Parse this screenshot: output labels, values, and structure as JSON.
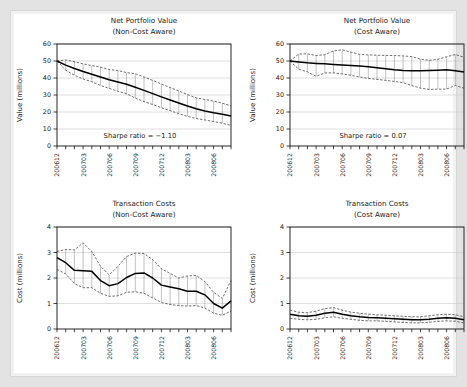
{
  "figure": {
    "background": "#ffffff",
    "frame_color": "#d8d8d8",
    "mean_color": "#000000",
    "band_color": "#333333",
    "grid_color": "#c9c9c9"
  },
  "chart_data": [
    {
      "id": "net-portfolio-value-non-cost-aware",
      "type": "line",
      "title": "Net Portfolio Value",
      "subtitle": "(Non-Cost Aware)",
      "xlabel": "",
      "ylabel": "Value (millions)",
      "ylim": [
        0,
        60
      ],
      "yticks": [
        0,
        10,
        20,
        30,
        40,
        50,
        60
      ],
      "grid": true,
      "legend": "none",
      "annotation": "Sharpe ratio = −1.10",
      "x_tick_labels": [
        "200612",
        "200703",
        "200706",
        "200709",
        "200712",
        "200803",
        "200806"
      ],
      "x_tick_positions": [
        0,
        3,
        6,
        9,
        12,
        15,
        18
      ],
      "x": [
        0,
        1,
        2,
        3,
        4,
        5,
        6,
        7,
        8,
        9,
        10,
        11,
        12,
        13,
        14,
        15,
        16,
        17,
        18,
        19,
        20
      ],
      "series": [
        {
          "name": "mean",
          "style": "solid",
          "values": [
            50.0,
            47.6,
            45.6,
            43.8,
            42.2,
            40.6,
            39.0,
            37.6,
            36.3,
            34.6,
            32.7,
            30.8,
            28.9,
            27.1,
            25.3,
            23.5,
            21.9,
            20.6,
            19.5,
            18.7,
            17.6
          ]
        },
        {
          "name": "upper",
          "style": "dashed",
          "values": [
            50.0,
            50.6,
            49.6,
            48.3,
            47.3,
            46.4,
            45.0,
            44.4,
            43.2,
            42.5,
            40.6,
            38.6,
            36.5,
            34.4,
            32.4,
            30.3,
            28.3,
            27.4,
            26.4,
            25.2,
            23.6
          ]
        },
        {
          "name": "lower",
          "style": "dashed",
          "values": [
            50.0,
            44.6,
            41.6,
            39.4,
            37.8,
            35.6,
            33.9,
            32.2,
            30.7,
            28.2,
            26.1,
            24.4,
            22.5,
            20.8,
            19.0,
            17.4,
            16.2,
            15.3,
            14.4,
            13.4,
            12.1
          ]
        }
      ]
    },
    {
      "id": "net-portfolio-value-cost-aware",
      "type": "line",
      "title": "Net Portfolio Value",
      "subtitle": "(Cost Aware)",
      "xlabel": "",
      "ylabel": "Value (millions)",
      "ylim": [
        0,
        60
      ],
      "yticks": [
        0,
        10,
        20,
        30,
        40,
        50,
        60
      ],
      "grid": true,
      "legend": "none",
      "annotation": "Sharpe ratio = 0.07",
      "x_tick_labels": [
        "200612",
        "200703",
        "200706",
        "200709",
        "200712",
        "200803",
        "200806"
      ],
      "x_tick_positions": [
        0,
        3,
        6,
        9,
        12,
        15,
        18
      ],
      "x": [
        0,
        1,
        2,
        3,
        4,
        5,
        6,
        7,
        8,
        9,
        10,
        11,
        12,
        13,
        14,
        15,
        16,
        17,
        18,
        19,
        20
      ],
      "series": [
        {
          "name": "mean",
          "style": "solid",
          "values": [
            50.0,
            49.4,
            48.9,
            48.6,
            48.4,
            48.0,
            47.6,
            47.3,
            47.0,
            46.6,
            46.0,
            45.4,
            44.8,
            44.4,
            44.3,
            44.3,
            44.4,
            44.6,
            44.8,
            44.2,
            43.5
          ]
        },
        {
          "name": "upper",
          "style": "dashed",
          "values": [
            50.0,
            54.1,
            54.2,
            53.2,
            53.7,
            55.9,
            56.6,
            55.2,
            53.9,
            53.6,
            53.4,
            53.3,
            53.2,
            53.0,
            52.6,
            51.1,
            50.4,
            51.0,
            52.5,
            53.8,
            52.2
          ]
        },
        {
          "name": "lower",
          "style": "dashed",
          "values": [
            50.0,
            45.2,
            43.6,
            41.0,
            43.0,
            43.0,
            42.4,
            41.6,
            40.6,
            39.8,
            39.2,
            38.6,
            38.0,
            37.2,
            35.6,
            34.0,
            33.3,
            33.4,
            33.5,
            35.6,
            34.0
          ]
        }
      ]
    },
    {
      "id": "transaction-costs-non-cost-aware",
      "type": "line",
      "title": "Transaction Costs",
      "subtitle": "(Non-Cost Aware)",
      "xlabel": "",
      "ylabel": "Cost (millions)",
      "ylim": [
        0,
        4
      ],
      "yticks": [
        0,
        1,
        2,
        3,
        4
      ],
      "grid": true,
      "legend": "none",
      "annotation": "",
      "x_tick_labels": [
        "200612",
        "200703",
        "200706",
        "200709",
        "200712",
        "200803",
        "200806"
      ],
      "x_tick_positions": [
        0,
        3,
        6,
        9,
        12,
        15,
        18
      ],
      "x": [
        0,
        1,
        2,
        3,
        4,
        5,
        6,
        7,
        8,
        9,
        10,
        11,
        12,
        13,
        14,
        15,
        16,
        17,
        18,
        19,
        20
      ],
      "series": [
        {
          "name": "mean",
          "style": "solid",
          "values": [
            2.8,
            2.6,
            2.3,
            2.28,
            2.26,
            1.9,
            1.7,
            1.78,
            2.02,
            2.18,
            2.2,
            2.0,
            1.72,
            1.65,
            1.58,
            1.48,
            1.48,
            1.34,
            1.0,
            0.82,
            1.1
          ]
        },
        {
          "name": "upper",
          "style": "dashed",
          "values": [
            3.04,
            3.12,
            3.1,
            3.38,
            3.04,
            2.46,
            2.12,
            2.46,
            2.84,
            2.98,
            2.96,
            2.72,
            2.36,
            2.18,
            2.0,
            2.08,
            2.1,
            1.86,
            1.44,
            1.2,
            1.9
          ]
        },
        {
          "name": "lower",
          "style": "dashed",
          "values": [
            2.34,
            2.16,
            1.78,
            1.62,
            1.62,
            1.4,
            1.28,
            1.3,
            1.44,
            1.46,
            1.4,
            1.22,
            1.04,
            0.96,
            0.92,
            0.9,
            0.92,
            0.82,
            0.62,
            0.54,
            0.7
          ]
        }
      ]
    },
    {
      "id": "transaction-costs-cost-aware",
      "type": "line",
      "title": "Transaction Costs",
      "subtitle": "(Cost Aware)",
      "xlabel": "",
      "ylabel": "Cost (millions)",
      "ylim": [
        0,
        4
      ],
      "yticks": [
        0,
        1,
        2,
        3,
        4
      ],
      "grid": true,
      "legend": "none",
      "annotation": "",
      "x_tick_labels": [
        "200612",
        "200703",
        "200706",
        "200709",
        "200712",
        "200803",
        "200806"
      ],
      "x_tick_positions": [
        0,
        3,
        6,
        9,
        12,
        15,
        18
      ],
      "x": [
        0,
        1,
        2,
        3,
        4,
        5,
        6,
        7,
        8,
        9,
        10,
        11,
        12,
        13,
        14,
        15,
        16,
        17,
        18,
        19,
        20
      ],
      "series": [
        {
          "name": "mean",
          "style": "solid",
          "values": [
            0.58,
            0.52,
            0.5,
            0.54,
            0.62,
            0.66,
            0.58,
            0.52,
            0.48,
            0.45,
            0.44,
            0.42,
            0.4,
            0.38,
            0.36,
            0.36,
            0.38,
            0.42,
            0.44,
            0.42,
            0.36
          ]
        },
        {
          "name": "upper",
          "style": "dashed",
          "values": [
            0.74,
            0.66,
            0.64,
            0.7,
            0.8,
            0.84,
            0.74,
            0.66,
            0.62,
            0.58,
            0.56,
            0.54,
            0.52,
            0.5,
            0.48,
            0.48,
            0.52,
            0.56,
            0.58,
            0.56,
            0.48
          ]
        },
        {
          "name": "lower",
          "style": "dashed",
          "values": [
            0.42,
            0.38,
            0.36,
            0.38,
            0.44,
            0.48,
            0.42,
            0.38,
            0.34,
            0.32,
            0.32,
            0.3,
            0.28,
            0.26,
            0.24,
            0.24,
            0.26,
            0.3,
            0.32,
            0.3,
            0.24
          ]
        }
      ]
    }
  ]
}
